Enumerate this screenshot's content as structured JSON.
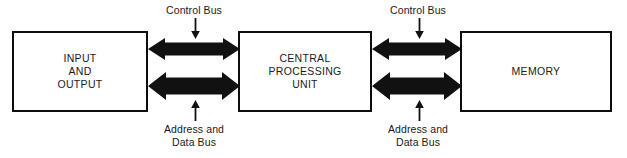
{
  "diagram": {
    "colors": {
      "stroke": "#0d0d0d",
      "fill": "#ffffff",
      "arrow": "#111111",
      "text": "#1a1a1a"
    },
    "boxes": [
      {
        "id": "io",
        "label": "INPUT\nAND\nOUTPUT"
      },
      {
        "id": "cpu",
        "label": "CENTRAL\nPROCESSING\nUNIT"
      },
      {
        "id": "memory",
        "label": "MEMORY"
      }
    ],
    "buses": [
      {
        "id": "control-left",
        "label": "Control Bus",
        "direction": "bidirectional",
        "pointer": "down"
      },
      {
        "id": "control-right",
        "label": "Control Bus",
        "direction": "bidirectional",
        "pointer": "down"
      },
      {
        "id": "data-left",
        "label": "Address and\nData Bus",
        "direction": "bidirectional",
        "pointer": "up"
      },
      {
        "id": "data-right",
        "label": "Address and\nData Bus",
        "direction": "bidirectional",
        "pointer": "up"
      }
    ]
  }
}
